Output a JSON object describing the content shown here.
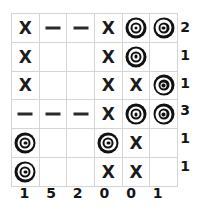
{
  "puzzle": {
    "type": "nonogram-style-grid",
    "rows": 6,
    "cols": 6,
    "symbols": {
      "x": "X",
      "dash": "—",
      "target": "bullseye",
      "empty": ""
    },
    "cells": [
      [
        "x",
        "dash",
        "dash",
        "x",
        "target",
        "target"
      ],
      [
        "x",
        "empty",
        "empty",
        "x",
        "target",
        "empty"
      ],
      [
        "x",
        "empty",
        "empty",
        "x",
        "x",
        "target"
      ],
      [
        "dash",
        "dash",
        "dash",
        "x",
        "target",
        "target"
      ],
      [
        "target",
        "empty",
        "empty",
        "target",
        "x",
        "empty"
      ],
      [
        "target",
        "empty",
        "empty",
        "x",
        "x",
        "empty"
      ]
    ],
    "row_clues": [
      "2",
      "1",
      "1",
      "3",
      "1",
      "1"
    ],
    "col_clues": [
      "1",
      "5",
      "2",
      "0",
      "0",
      "1"
    ],
    "colors": {
      "ink": "#141414",
      "grid_line": "#d4d4d4",
      "border": "#c9c9c9",
      "background": "#ffffff"
    }
  }
}
